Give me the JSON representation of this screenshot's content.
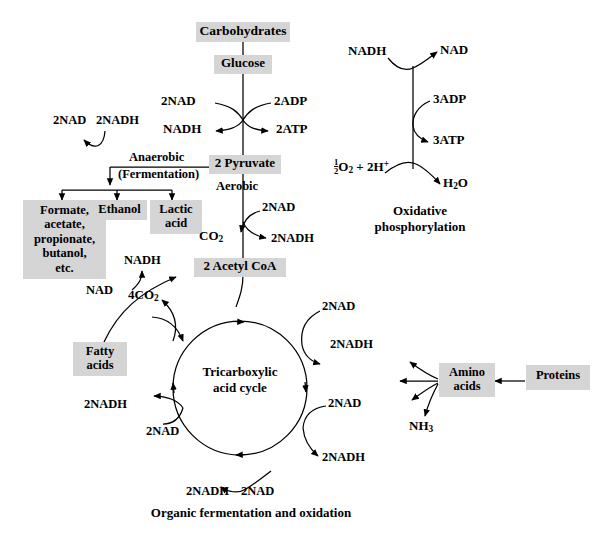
{
  "figure": {
    "caption": "Organic fermentation and oxidation",
    "box_fill": "#d5d5d5",
    "stroke": "#000000"
  },
  "glycolysis": {
    "carbohydrates": "Carbohydrates",
    "glucose": "Glucose",
    "nad_in": "2NAD",
    "adp_in": "2ADP",
    "nadh_out": "NADH",
    "atp_out": "2ATP",
    "pyruvate": "2 Pyruvate"
  },
  "fermentation": {
    "anaerobic": "Anaerobic",
    "fermentation": "(Fermentation)",
    "nad_out": "2NAD",
    "nadh_in": "2NADH",
    "products": [
      "Formate,",
      "acetate,",
      "propionate,",
      "butanol,",
      "etc."
    ],
    "ethanol": "Ethanol",
    "lactic_acid_l1": "Lactic",
    "lactic_acid_l2": "acid"
  },
  "pyruvate_oxidation": {
    "aerobic": "Aerobic",
    "nad_in": "2NAD",
    "co2_out": "CO",
    "co2_sub": "2",
    "nadh_out": "2NADH",
    "acetyl_coa": "2 Acetyl CoA"
  },
  "fatty_acids": {
    "label_l1": "Fatty",
    "label_l2": "acids",
    "nad_in": "NAD",
    "nadh_out": "NADH"
  },
  "tca": {
    "name_l1": "Tricarboxylic",
    "name_l2": "acid cycle",
    "co2_out": "4CO",
    "co2_sub": "2",
    "right_upper_nad": "2NAD",
    "right_upper_nadh": "2NADH",
    "right_lower_nad": "2NAD",
    "right_lower_nadh": "2NADH",
    "bottom_nadh": "2NADH",
    "bottom_nad": "2NAD",
    "left_nadh": "2NADH",
    "left_nad": "2NAD"
  },
  "protein_branch": {
    "amino_acids_l1": "Amino",
    "amino_acids_l2": "acids",
    "proteins": "Proteins",
    "ammonia": "NH",
    "ammonia_sub": "3"
  },
  "oxidative_phosphorylation": {
    "nadh_in": "NADH",
    "nad_out": "NAD",
    "adp_in": "3ADP",
    "atp_out": "3ATP",
    "oxygen_num": "1",
    "oxygen_den": "2",
    "oxygen_rest": "O",
    "oxygen_sub": "2",
    "oxygen_tail": " + 2H",
    "oxygen_sup": "+",
    "water": "H",
    "water_sub": "2",
    "water_tail": "O",
    "title_l1": "Oxidative",
    "title_l2": "phosphorylation"
  }
}
